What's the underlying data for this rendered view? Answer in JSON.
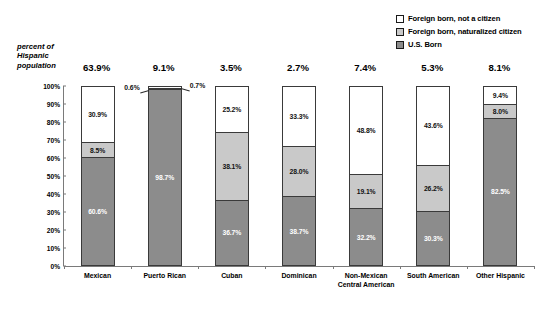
{
  "axis_caption": "percent of\nHispanic\npopulation",
  "legend": {
    "items": [
      {
        "label": "Foreign born, not a citizen",
        "swatch": "white",
        "color": "#ffffff"
      },
      {
        "label": "Foreign born, naturalized citizen",
        "swatch": "light-gray",
        "color": "#c9c9c9"
      },
      {
        "label": "U.S. Born",
        "swatch": "dark-gray",
        "color": "#8c8c8c"
      }
    ]
  },
  "chart_data": {
    "type": "bar",
    "stacked": true,
    "title": "",
    "xlabel": "",
    "ylabel": "",
    "ylim": [
      0,
      100
    ],
    "grid": false,
    "legend_position": "top-right",
    "categories": [
      "Mexican",
      "Puerto Rican",
      "Cuban",
      "Dominican",
      "Non-Mexican Central American",
      "South American",
      "Other Hispanic"
    ],
    "ytick_labels": [
      "100%",
      "90%",
      "80%",
      "70%",
      "60%",
      "50%",
      "40%",
      "30%",
      "20%",
      "10%",
      "0%"
    ],
    "ytick_values": [
      100,
      90,
      80,
      70,
      60,
      50,
      40,
      30,
      20,
      10,
      0
    ],
    "share_of_hispanic_population": [
      "63.9%",
      "9.1%",
      "3.5%",
      "2.7%",
      "7.4%",
      "5.3%",
      "8.1%"
    ],
    "series": [
      {
        "name": "Foreign born, not a citizen",
        "color": "#ffffff",
        "values": [
          30.9,
          0.7,
          25.2,
          33.3,
          48.8,
          43.6,
          9.4
        ],
        "labels": [
          "30.9%",
          "0.7%",
          "25.2%",
          "33.3%",
          "48.8%",
          "43.6%",
          "9.4%"
        ]
      },
      {
        "name": "Foreign born, naturalized citizen",
        "color": "#c9c9c9",
        "values": [
          8.5,
          0.6,
          38.1,
          28.0,
          19.1,
          26.2,
          8.0
        ],
        "labels": [
          "8.5%",
          "0.6%",
          "38.1%",
          "28.0%",
          "19.1%",
          "26.2%",
          "8.0%"
        ]
      },
      {
        "name": "U.S. Born",
        "color": "#8c8c8c",
        "values": [
          60.6,
          98.7,
          36.7,
          38.7,
          32.2,
          30.3,
          82.5
        ],
        "labels": [
          "60.6%",
          "98.7%",
          "36.7%",
          "38.7%",
          "32.2%",
          "30.3%",
          "82.5%"
        ]
      }
    ],
    "callouts": [
      {
        "category": "Puerto Rican",
        "series": "Foreign born, naturalized citizen",
        "label": "0.6%",
        "side": "left"
      },
      {
        "category": "Puerto Rican",
        "series": "Foreign born, not a citizen",
        "label": "0.7%",
        "side": "right"
      }
    ]
  }
}
